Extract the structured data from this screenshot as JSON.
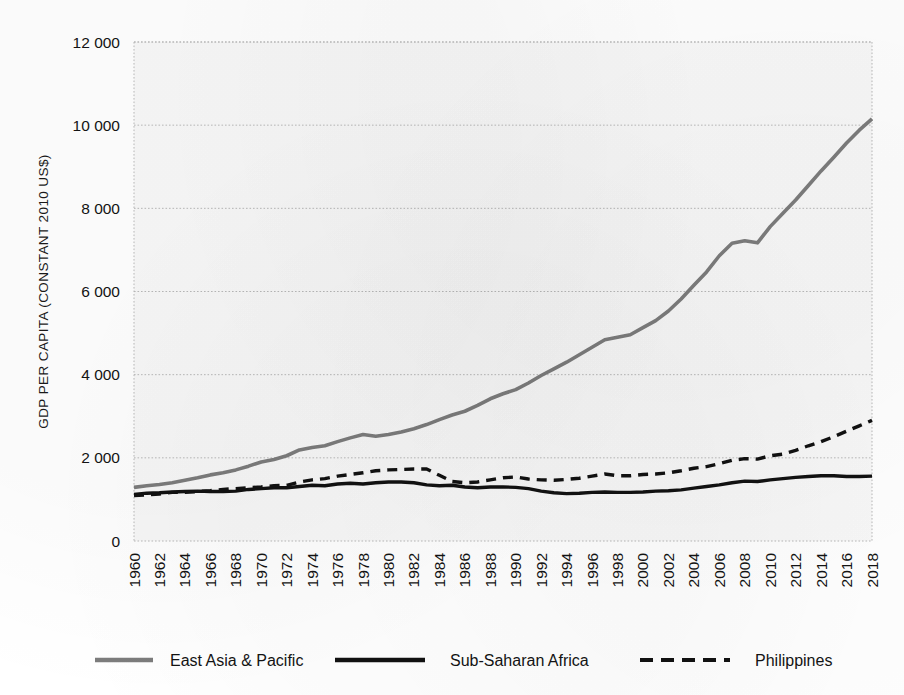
{
  "chart_data": {
    "type": "line",
    "title": "",
    "xlabel": "",
    "ylabel": "GDP PER CAPITA (CONSTANT 2010 US$)",
    "xlim": [
      1960,
      2018
    ],
    "ylim": [
      0,
      12000
    ],
    "yticks": [
      0,
      2000,
      4000,
      6000,
      8000,
      10000,
      12000
    ],
    "ytick_labels": [
      "0",
      "2 000",
      "4 000",
      "6 000",
      "8 000",
      "10 000",
      "12 000"
    ],
    "xtick_labels": [
      "1960",
      "1962",
      "1964",
      "1966",
      "1968",
      "1970",
      "1972",
      "1974",
      "1976",
      "1978",
      "1980",
      "1982",
      "1984",
      "1986",
      "1988",
      "1990",
      "1992",
      "1994",
      "1996",
      "1998",
      "2000",
      "2002",
      "2004",
      "2006",
      "2008",
      "2010",
      "2012",
      "2014",
      "2016",
      "2018"
    ],
    "grid": "horizontal-dotted",
    "legend_position": "bottom",
    "x": [
      1960,
      1961,
      1962,
      1963,
      1964,
      1965,
      1966,
      1967,
      1968,
      1969,
      1970,
      1971,
      1972,
      1973,
      1974,
      1975,
      1976,
      1977,
      1978,
      1979,
      1980,
      1981,
      1982,
      1983,
      1984,
      1985,
      1986,
      1987,
      1988,
      1989,
      1990,
      1991,
      1992,
      1993,
      1994,
      1995,
      1996,
      1997,
      1998,
      1999,
      2000,
      2001,
      2002,
      2003,
      2004,
      2005,
      2006,
      2007,
      2008,
      2009,
      2010,
      2011,
      2012,
      2013,
      2014,
      2015,
      2016,
      2017,
      2018
    ],
    "series": [
      {
        "name": "East Asia & Pacific",
        "color": "#7c7c7c",
        "style": "solid",
        "values": [
          1290,
          1330,
          1360,
          1400,
          1460,
          1520,
          1590,
          1640,
          1710,
          1800,
          1900,
          1960,
          2050,
          2190,
          2250,
          2290,
          2390,
          2480,
          2560,
          2520,
          2560,
          2620,
          2700,
          2800,
          2920,
          3030,
          3120,
          3260,
          3420,
          3540,
          3640,
          3800,
          3980,
          4140,
          4300,
          4480,
          4660,
          4840,
          4900,
          4960,
          5130,
          5300,
          5530,
          5820,
          6150,
          6470,
          6860,
          7160,
          7220,
          7170,
          7560,
          7880,
          8200,
          8550,
          8900,
          9230,
          9570,
          9880,
          10150
        ]
      },
      {
        "name": "Sub-Saharan Africa",
        "color": "#111111",
        "style": "solid",
        "values": [
          1120,
          1150,
          1160,
          1180,
          1190,
          1200,
          1190,
          1190,
          1200,
          1240,
          1260,
          1280,
          1280,
          1310,
          1340,
          1330,
          1370,
          1390,
          1370,
          1400,
          1420,
          1420,
          1400,
          1350,
          1330,
          1340,
          1300,
          1280,
          1300,
          1300,
          1290,
          1260,
          1200,
          1160,
          1140,
          1150,
          1170,
          1180,
          1170,
          1170,
          1180,
          1200,
          1210,
          1230,
          1270,
          1310,
          1350,
          1400,
          1440,
          1430,
          1470,
          1500,
          1530,
          1550,
          1570,
          1570,
          1550,
          1550,
          1560
        ]
      },
      {
        "name": "Philippines",
        "color": "#111111",
        "style": "dashed",
        "values": [
          1090,
          1110,
          1130,
          1170,
          1170,
          1190,
          1210,
          1240,
          1260,
          1280,
          1300,
          1330,
          1340,
          1420,
          1470,
          1500,
          1560,
          1600,
          1640,
          1690,
          1710,
          1720,
          1730,
          1730,
          1580,
          1430,
          1400,
          1420,
          1470,
          1520,
          1540,
          1490,
          1470,
          1460,
          1480,
          1510,
          1560,
          1610,
          1570,
          1570,
          1600,
          1610,
          1640,
          1690,
          1750,
          1790,
          1860,
          1940,
          1980,
          1970,
          2050,
          2090,
          2180,
          2290,
          2390,
          2510,
          2640,
          2770,
          2900
        ]
      }
    ]
  },
  "legend": {
    "items": [
      {
        "label": "East Asia & Pacific",
        "color": "#7c7c7c",
        "style": "solid"
      },
      {
        "label": "Sub-Saharan Africa",
        "color": "#111111",
        "style": "solid"
      },
      {
        "label": "Philippines",
        "color": "#111111",
        "style": "dashed"
      }
    ]
  },
  "colors": {
    "east_asia": "#7c7c7c",
    "sub_saharan": "#111111",
    "philippines": "#111111",
    "grid": "#b9b9b9",
    "plot_background": "#f2f2f2"
  }
}
